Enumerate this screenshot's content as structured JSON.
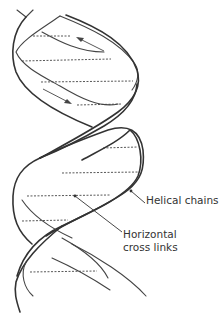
{
  "figure": {
    "type": "double-helix-diagram",
    "labels": {
      "helical_chains": "Helical chains",
      "cross_links_line1": "Horizontal",
      "cross_links_line2": "cross links"
    },
    "colors": {
      "background": "#ffffff",
      "ink": "#333333"
    },
    "cross_link_count": 9,
    "direction_arrows": 2
  }
}
